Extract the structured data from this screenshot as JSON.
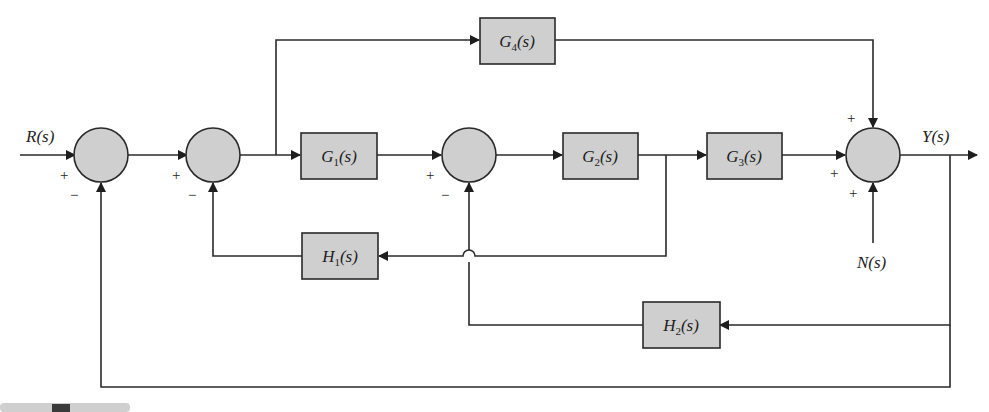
{
  "diagram": {
    "type": "control-system-block-diagram",
    "signals": {
      "input": "R(s)",
      "output": "Y(s)",
      "disturbance": "N(s)"
    },
    "blocks": [
      {
        "id": "G1",
        "base": "G",
        "sub": "1",
        "arg": "(s)"
      },
      {
        "id": "G2",
        "base": "G",
        "sub": "2",
        "arg": "(s)"
      },
      {
        "id": "G3",
        "base": "G",
        "sub": "3",
        "arg": "(s)"
      },
      {
        "id": "G4",
        "base": "G",
        "sub": "4",
        "arg": "(s)"
      },
      {
        "id": "H1",
        "base": "H",
        "sub": "1",
        "arg": "(s)"
      },
      {
        "id": "H2",
        "base": "H",
        "sub": "2",
        "arg": "(s)"
      }
    ],
    "summing_junctions": [
      {
        "id": "S1",
        "signs": {
          "left": "+",
          "bottom": "−"
        }
      },
      {
        "id": "S2",
        "signs": {
          "left": "+",
          "bottom": "−"
        }
      },
      {
        "id": "S3",
        "signs": {
          "left": "+",
          "bottom": "−"
        }
      },
      {
        "id": "S4",
        "signs": {
          "top": "+",
          "left": "+",
          "bottom": "+"
        }
      }
    ],
    "connections": [
      "R(s) -> S1(+)",
      "S1 -> S2(+)",
      "S2 -> G1",
      "S2 output -> G4 (feedforward)",
      "G1 -> S3(+)",
      "S3 -> G2",
      "G2 -> G3",
      "G2 output -> H1 -> S2(−)",
      "G3 -> S4(+)",
      "G4 -> S4(+)",
      "N(s) -> S4(+)",
      "S4 -> Y(s)",
      "Y(s) -> H2 -> S3(−)",
      "Y(s) -> S1(−) (unity feedback)"
    ]
  }
}
